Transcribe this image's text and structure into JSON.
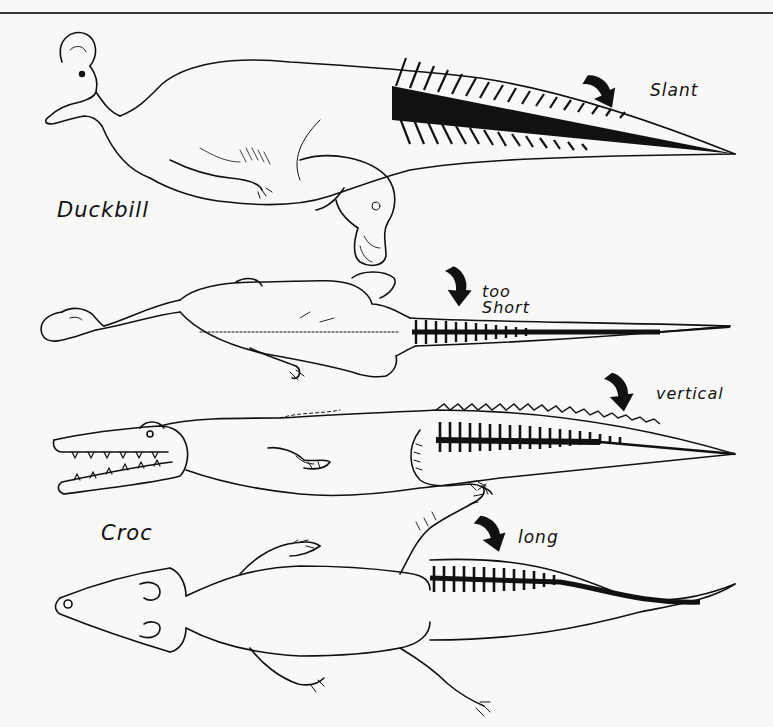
{
  "figure": {
    "labels": {
      "slant": "Slant",
      "too_short_line1": "too",
      "too_short_line2": "Short",
      "vertical": "vertical",
      "long": "long",
      "duckbill": "Duckbill",
      "croc": "Croc"
    },
    "panels": [
      {
        "animal": "Duckbill",
        "view": "side",
        "annotation": "Slant"
      },
      {
        "animal": "Duckbill",
        "view": "top",
        "annotation": "too Short"
      },
      {
        "animal": "Croc",
        "view": "side",
        "annotation": "vertical"
      },
      {
        "animal": "Croc",
        "view": "top",
        "annotation": "long"
      }
    ],
    "colors": {
      "ink": "#111111",
      "paper": "#f8f8f6"
    }
  }
}
